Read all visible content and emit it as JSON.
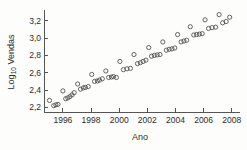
{
  "chart_data": {
    "type": "scatter",
    "title": "",
    "xlabel": "Ano",
    "ylabel": "Log10 Vendas",
    "ylabel_base": "Log",
    "ylabel_sub": "10",
    "ylabel_rest": " Vendas",
    "xlim": [
      1994.8,
      2008.3
    ],
    "ylim": [
      2.17,
      3.3
    ],
    "xticks": [
      1996,
      1998,
      2000,
      2002,
      2004,
      2006,
      2008
    ],
    "xtick_labels": [
      "1996",
      "1998",
      "2000",
      "2002",
      "2004",
      "2006",
      "2008"
    ],
    "yticks": [
      2.2,
      2.4,
      2.6,
      2.8,
      3.0,
      3.2
    ],
    "ytick_labels": [
      "2,2",
      "2,4",
      "2,6",
      "2,8",
      "3,0",
      "3,2"
    ],
    "grid": false,
    "legend": false,
    "marker": "open-circle",
    "marker_color": "#4a4a4a",
    "axis_color": "#555555",
    "background": "#fdfdfc",
    "x": [
      1995.05,
      1995.35,
      1995.5,
      1995.65,
      1996.0,
      1996.2,
      1996.35,
      1996.5,
      1996.65,
      1996.8,
      1997.05,
      1997.25,
      1997.45,
      1997.6,
      1997.8,
      1998.05,
      1998.25,
      1998.45,
      1998.6,
      1998.8,
      1999.05,
      1999.25,
      1999.45,
      1999.6,
      1999.8,
      2000.05,
      2000.3,
      2000.55,
      2000.8,
      2001.05,
      2001.3,
      2001.5,
      2001.7,
      2001.9,
      2002.1,
      2002.3,
      2002.5,
      2002.7,
      2002.9,
      2003.1,
      2003.35,
      2003.55,
      2003.75,
      2003.95,
      2004.15,
      2004.4,
      2004.6,
      2004.8,
      2005.05,
      2005.3,
      2005.5,
      2005.7,
      2005.9,
      2006.1,
      2006.35,
      2006.6,
      2006.85,
      2007.1,
      2007.35,
      2007.6,
      2007.85
    ],
    "y": [
      2.28,
      2.22,
      2.23,
      2.235,
      2.39,
      2.3,
      2.31,
      2.325,
      2.345,
      2.37,
      2.47,
      2.41,
      2.425,
      2.43,
      2.44,
      2.58,
      2.5,
      2.505,
      2.515,
      2.53,
      2.62,
      2.545,
      2.55,
      2.555,
      2.545,
      2.73,
      2.635,
      2.645,
      2.65,
      2.81,
      2.705,
      2.715,
      2.73,
      2.745,
      2.89,
      2.79,
      2.8,
      2.805,
      2.81,
      2.955,
      2.86,
      2.87,
      2.875,
      2.885,
      3.04,
      2.955,
      2.965,
      2.975,
      3.13,
      3.035,
      3.04,
      3.045,
      3.05,
      3.21,
      3.11,
      3.12,
      3.125,
      3.27,
      3.175,
      3.19,
      3.24
    ]
  }
}
